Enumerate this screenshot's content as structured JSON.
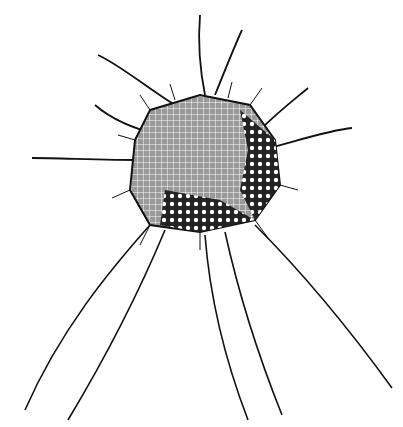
{
  "image": {
    "subject": "radiolarian illustration",
    "style": "black ink line drawing on white",
    "colors": {
      "background": "#ffffff",
      "ink": "#111111",
      "mesh": "#555555"
    },
    "width": 403,
    "height": 427
  }
}
